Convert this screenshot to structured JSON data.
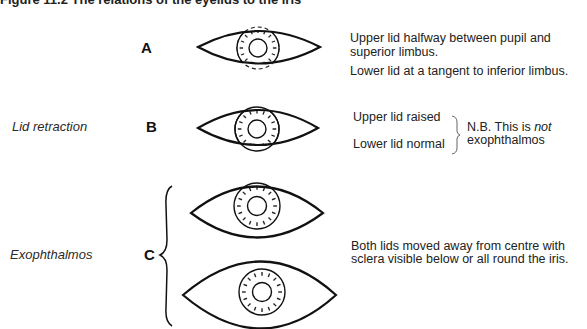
{
  "figure": {
    "title": "Figure 11.2   The relations of the eyelids to the iris"
  },
  "rows": [
    {
      "letter": "A",
      "label": "",
      "notes": [
        "Upper lid halfway between pupil and superior limbus.",
        "Lower lid at a tangent to inferior limbus."
      ]
    },
    {
      "letter": "B",
      "label": "Lid retraction",
      "notes": [
        "Upper lid raised",
        "Lower lid normal"
      ],
      "nb_prefix": "N.B. This is ",
      "nb_emph": "not",
      "nb_suffix": "exophthalmos"
    },
    {
      "letter": "C",
      "label": "Exophthalmos",
      "notes": [
        "Both lids moved away from centre with sclera visible below or all round the iris."
      ]
    }
  ],
  "text": {
    "a_note_1_line1": "Upper lid halfway between pupil and",
    "a_note_1_line2": "superior limbus.",
    "a_note_2": "Lower lid at a tangent to inferior limbus.",
    "b_note_upper": "Upper lid raised",
    "b_note_lower": "Lower lid normal",
    "b_nb_line1_prefix": "N.B. This is ",
    "b_nb_line1_emph": "not",
    "b_nb_line2": "exophthalmos",
    "c_note_line1": "Both lids moved away from centre with",
    "c_note_line2": "sclera visible below or all round the iris."
  }
}
